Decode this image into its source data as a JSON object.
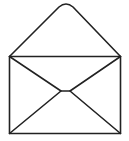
{
  "icon": {
    "name": "open-envelope",
    "stroke_color": "#222222",
    "background": "#ffffff"
  }
}
